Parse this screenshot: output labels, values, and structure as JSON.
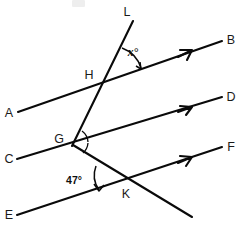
{
  "figure": {
    "background_color": "#ffffff",
    "stroke_color": "#0a0a0a",
    "width": 244,
    "height": 228
  },
  "points": {
    "H": {
      "label": "H",
      "x": 96,
      "y": 75,
      "vertex_x": 108,
      "vertex_y": 79
    },
    "G": {
      "label": "G",
      "x": 59,
      "y": 139,
      "vertex_x": 74,
      "vertex_y": 143
    },
    "K": {
      "label": "K",
      "x": 122,
      "y": 195,
      "vertex_x": 120,
      "vertex_y": 184
    }
  },
  "endpoint_labels": {
    "A": {
      "label": "A",
      "x": 7,
      "y": 114
    },
    "B": {
      "label": "B",
      "x": 227,
      "y": 44
    },
    "C": {
      "label": "C",
      "x": 7,
      "y": 161
    },
    "D": {
      "label": "D",
      "x": 227,
      "y": 101
    },
    "E": {
      "label": "E",
      "x": 7,
      "y": 218
    },
    "F": {
      "label": "F",
      "x": 227,
      "y": 151
    },
    "L": {
      "label": "L",
      "x": 124,
      "y": 14
    }
  },
  "angles": [
    {
      "name": "x-angle",
      "label": "x°",
      "label_x": 131,
      "label_y": 56,
      "vertex": "H",
      "value": null,
      "italic": true
    },
    {
      "name": "forty-seven-angle",
      "label": "47°",
      "label_x": 73,
      "label_y": 181,
      "vertex": "K",
      "value": 47,
      "italic": false
    }
  ],
  "lines": [
    {
      "name": "line-AB",
      "from_label": "A",
      "to_label": "B",
      "x1": 18,
      "y1": 112,
      "x2": 222,
      "y2": 41,
      "has_arrow": true,
      "arrow_x": 188,
      "arrow_y": 52,
      "parallel_group": 1
    },
    {
      "name": "line-CD",
      "from_label": "C",
      "to_label": "D",
      "x1": 17,
      "y1": 159,
      "x2": 222,
      "y2": 97,
      "has_arrow": true,
      "arrow_x": 188,
      "arrow_y": 107,
      "parallel_group": 1
    },
    {
      "name": "line-EF",
      "from_label": "E",
      "to_label": "F",
      "x1": 17,
      "y1": 215,
      "x2": 222,
      "y2": 147,
      "has_arrow": true,
      "arrow_x": 188,
      "arrow_y": 158,
      "parallel_group": 1
    },
    {
      "name": "transversal-LG",
      "from_label": "L",
      "to_label": "G",
      "x1": 132,
      "y1": 22,
      "x2": 72,
      "y2": 145,
      "has_arrow": false,
      "parallel_group": 2
    },
    {
      "name": "transversal-GK-extended",
      "from_label": "G",
      "to_label": "K",
      "x1": 73,
      "y1": 146,
      "x2": 192,
      "y2": 217,
      "has_arrow": false,
      "parallel_group": 3
    }
  ],
  "parallel_marks": {
    "count": 3,
    "description": "single arrowhead on each of the three parallel lines"
  }
}
